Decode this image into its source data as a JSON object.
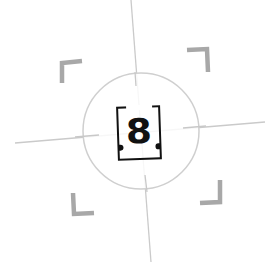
{
  "reticle": {
    "target_number": "8",
    "colors": {
      "crosshair": "#c8c8c8",
      "circle": "#cfcfcf",
      "corner_brackets": "#a8a8a8",
      "target_box": "#111111"
    },
    "circle": {
      "cx": 141,
      "cy": 131,
      "r": 58
    },
    "crosshair": {
      "horizontal": {
        "x1": 15,
        "y1": 143,
        "x2": 265,
        "y2": 123
      },
      "vertical": {
        "x1": 130,
        "y1": 0,
        "x2": 150,
        "y2": 262
      }
    },
    "corner_brackets": [
      "top-left",
      "top-right",
      "bottom-left",
      "bottom-right"
    ]
  }
}
